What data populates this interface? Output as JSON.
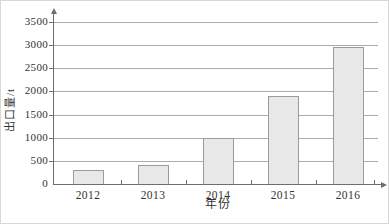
{
  "chart_data": {
    "type": "bar",
    "title": "",
    "categories": [
      "2012",
      "2013",
      "2014",
      "2015",
      "2016"
    ],
    "values": [
      300,
      420,
      1000,
      1900,
      2950
    ],
    "xlabel": "年份",
    "ylabel": "出口量/t",
    "ylim": [
      0,
      3500
    ],
    "yticks": [
      0,
      500,
      1000,
      1500,
      2000,
      2500,
      3000,
      3500
    ],
    "grid": true,
    "legend_position": "none",
    "colors": {
      "bar_fill": "#e8e8e8",
      "bar_border": "#9b9b9b",
      "gridline": "#ababab",
      "axis": "#6e6e6e",
      "text": "#333333",
      "frame_border": "#d8d8d8",
      "background": "#ffffff"
    }
  }
}
